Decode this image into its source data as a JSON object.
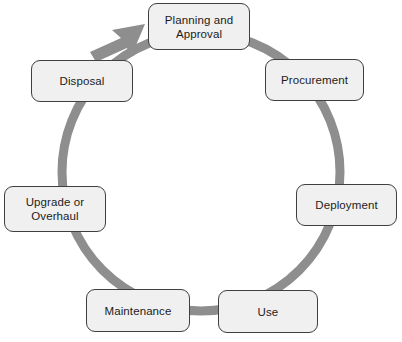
{
  "diagram": {
    "type": "cycle",
    "title": "",
    "direction": "clockwise",
    "colors": {
      "ring": "#8e8e8e",
      "node_fill": "#f0f0f0",
      "node_border": "#3f3f3f",
      "text": "#1c1c1c",
      "background": "#ffffff"
    },
    "ring": {
      "center_x": 201,
      "center_y": 172,
      "radius": 139,
      "stroke_width": 9
    },
    "arrow": {
      "name": "cycle-direction-arrowhead",
      "points_to": "Planning and Approval",
      "x": 90,
      "y": 24
    },
    "nodes": [
      {
        "id": "planning-and-approval",
        "label": "Planning and\nApproval",
        "x": 148,
        "y": 3,
        "w": 102,
        "h": 47,
        "angle_deg": 270
      },
      {
        "id": "procurement",
        "label": "Procurement",
        "x": 265,
        "y": 59,
        "w": 99,
        "h": 42,
        "angle_deg": 320
      },
      {
        "id": "deployment",
        "label": "Deployment",
        "x": 296,
        "y": 184,
        "w": 101,
        "h": 42,
        "angle_deg": 10
      },
      {
        "id": "use",
        "label": "Use",
        "x": 218,
        "y": 290,
        "w": 100,
        "h": 43,
        "angle_deg": 60
      },
      {
        "id": "maintenance",
        "label": "Maintenance",
        "x": 86,
        "y": 289,
        "w": 104,
        "h": 43,
        "angle_deg": 110
      },
      {
        "id": "upgrade-or-overhaul",
        "label": "Upgrade or\nOverhaul",
        "x": 4,
        "y": 186,
        "w": 102,
        "h": 46,
        "angle_deg": 170
      },
      {
        "id": "disposal",
        "label": "Disposal",
        "x": 31,
        "y": 60,
        "w": 102,
        "h": 42,
        "angle_deg": 220
      }
    ]
  }
}
